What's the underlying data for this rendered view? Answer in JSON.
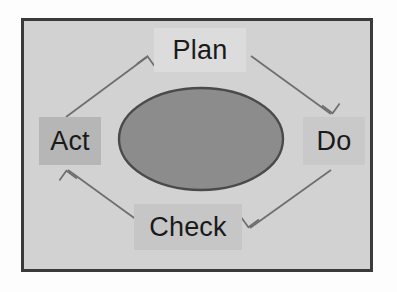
{
  "diagram": {
    "type": "pdca-cycle",
    "direction": "clockwise",
    "panel": {
      "background_color": "#d2d2d2",
      "border_color": "#3a3a3a"
    },
    "center_shape": {
      "name": "ellipse",
      "fill_color": "#8c8c8c",
      "stroke_color": "#4a4a4a",
      "label": ""
    },
    "nodes": [
      {
        "id": "plan",
        "label": "Plan",
        "position": "top",
        "chip_color": "#dcdcdc",
        "text_color": "#1a1a1a"
      },
      {
        "id": "do",
        "label": "Do",
        "position": "right",
        "chip_color": "#c9c9c9",
        "text_color": "#1a1a1a"
      },
      {
        "id": "check",
        "label": "Check",
        "position": "bottom",
        "chip_color": "#c6c6c6",
        "text_color": "#1a1a1a"
      },
      {
        "id": "act",
        "label": "Act",
        "position": "left",
        "chip_color": "#b6b6b6",
        "text_color": "#1a1a1a"
      }
    ],
    "arrows": [
      {
        "id": "act-to-plan",
        "from": "act",
        "to": "plan",
        "label": "",
        "color": "#6e6e6e"
      },
      {
        "id": "plan-to-do",
        "from": "plan",
        "to": "do",
        "label": "",
        "color": "#6e6e6e"
      },
      {
        "id": "do-to-check",
        "from": "do",
        "to": "check",
        "label": "",
        "color": "#6e6e6e"
      },
      {
        "id": "check-to-act",
        "from": "check",
        "to": "act",
        "label": "",
        "color": "#6e6e6e"
      }
    ]
  }
}
